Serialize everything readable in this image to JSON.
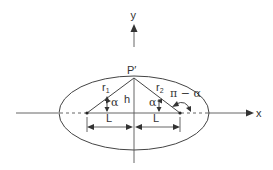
{
  "diagram": {
    "axes": {
      "x_label": "x",
      "y_label": "y"
    },
    "point_label": "P′",
    "height_label": "h",
    "left_radius_label": "r",
    "left_radius_sub": "1",
    "right_radius_label": "r",
    "right_radius_sub": "2",
    "left_angle_label": "α",
    "right_angle_label": "α",
    "exterior_angle_label": "π − α",
    "left_distance_label": "L",
    "right_distance_label": "L"
  }
}
